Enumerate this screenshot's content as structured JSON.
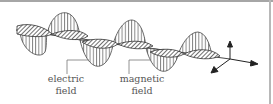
{
  "diagram": {
    "labels": [
      {
        "line1": "electric",
        "line2": "field"
      },
      {
        "line1": "magnetic",
        "line2": "field"
      }
    ],
    "colors": {
      "line": "#333333",
      "label_text": "#555555",
      "leader": "#777777",
      "border_top": "#a6a6a6",
      "border_right": "#b8b8b8"
    },
    "axes": {
      "icon": "3d-axes-icon",
      "directions": [
        "up",
        "right",
        "down-left"
      ]
    }
  }
}
